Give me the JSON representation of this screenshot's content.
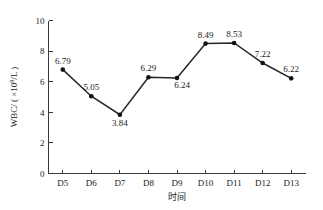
{
  "chart_data": {
    "type": "line",
    "title": "",
    "subtitle": "",
    "xlabel": "时间",
    "ylabel": "WBC/（×10⁹/L）",
    "ylabel_parts": {
      "prefix": "WBC/ ( ×10",
      "superscript": "9",
      "suffix": "/L )"
    },
    "categories": [
      "D5",
      "D6",
      "D7",
      "D8",
      "D9",
      "D10",
      "D11",
      "D12",
      "D13"
    ],
    "values": [
      6.79,
      5.05,
      3.84,
      6.29,
      6.24,
      8.49,
      8.53,
      7.22,
      6.22
    ],
    "point_labels": [
      "6.79",
      "5.05",
      "3.84",
      "6.29",
      "6.24",
      "8.49",
      "8.53",
      "7.22",
      "6.22"
    ],
    "point_label_positions": [
      "above",
      "above",
      "below",
      "above",
      "below-right",
      "above",
      "above",
      "above",
      "above"
    ],
    "ylim": [
      0,
      10
    ],
    "y_ticks": [
      0,
      2,
      4,
      6,
      8,
      10
    ],
    "y_tick_labels": [
      "0",
      "2",
      "4",
      "6",
      "8",
      "10"
    ],
    "grid": false,
    "legend": "none",
    "series_color": "#262626",
    "marker_color": "#111111",
    "axis_color": "#3a3a3a",
    "background_color": "#ffffff",
    "marker": "circle"
  }
}
